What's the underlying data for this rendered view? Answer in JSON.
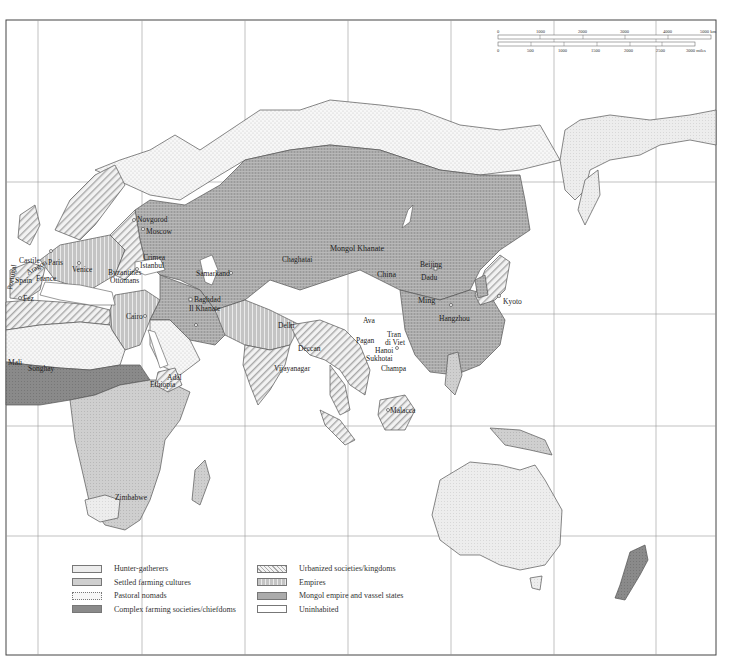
{
  "map": {
    "colors": {
      "hunter_gatherers": "#ececec",
      "settled_farming": "#cfcfcf",
      "pastoral_nomads": "#f4f4f4",
      "complex_farming": "#8a8a8a",
      "urbanized": "#e0e0e0",
      "empires": "#bdbdbd",
      "mongol": "#a9a9a9",
      "uninhabited": "#ffffff",
      "outline": "#555555",
      "grid": "#888888"
    },
    "scale": {
      "km_ticks": [
        "0",
        "1000",
        "2000",
        "3000",
        "4000",
        "5000 km"
      ],
      "mile_ticks": [
        "0",
        "500",
        "1000",
        "1500",
        "2000",
        "2500",
        "3000 miles"
      ]
    },
    "labels": {
      "novgorod": "Novgorod",
      "moscow": "Moscow",
      "paris": "Paris",
      "france": "France",
      "venice": "Venice",
      "castile": "Castile",
      "aragon": "Aragon",
      "portugal": "Portugal",
      "spain": "Spain",
      "fez": "Fez",
      "byzantines": "Byzantines",
      "crimea": "Crimea",
      "istanbul": "Istanbul",
      "ottomans": "Ottomans",
      "baghdad": "Baghdad",
      "il_khanate": "Il Khanate",
      "cairo": "Cairo",
      "samarkand": "Samarkand",
      "chaghatai": "Chaghatai",
      "mongol_khanate": "Mongol Khanate",
      "beijing": "Beijing",
      "dadu": "Dadu",
      "china": "China",
      "ming": "Ming",
      "hangzhou": "Hangzhou",
      "kyoto": "Kyoto",
      "delhi": "Delhi",
      "deccan": "Deccan",
      "vijayanagar": "Vijayanagar",
      "ava": "Ava",
      "pagan": "Pagan",
      "tran_1": "Tran",
      "tran_2": "di Viet",
      "hanoi": "Hanoi",
      "sukhotai": "Sukhotai",
      "champa": "Champa",
      "malacca": "Malacca",
      "mali": "Mali",
      "songhay": "Songhay",
      "adal": "Adal",
      "ethiopia": "Ethiopia",
      "zimbabwe": "Zimbabwe"
    }
  },
  "legend": {
    "left": [
      {
        "key": "hunter_gatherers",
        "label": "Hunter-gatherers"
      },
      {
        "key": "settled_farming",
        "label": "Settled farming cultures"
      },
      {
        "key": "pastoral_nomads",
        "label": "Pastoral nomads"
      },
      {
        "key": "complex_farming",
        "label": "Complex farming societies/chiefdoms"
      }
    ],
    "right": [
      {
        "key": "urbanized",
        "label": "Urbanized societies/kingdoms"
      },
      {
        "key": "empires",
        "label": "Empires"
      },
      {
        "key": "mongol",
        "label": "Mongol empire and vassel states"
      },
      {
        "key": "uninhabited",
        "label": "Uninhabited"
      }
    ]
  }
}
